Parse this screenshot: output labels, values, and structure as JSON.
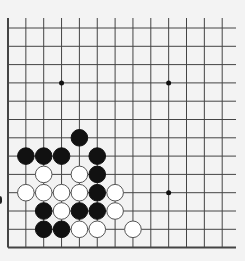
{
  "board": {
    "size": 13,
    "origin_x": 8,
    "origin_y": 28,
    "spacing_x": 17.85,
    "spacing_y": 18.3,
    "top_extend": 18,
    "right_extend": 236,
    "line_color": "#444444",
    "background": "#f3f3f3",
    "stone_radius": 8.3,
    "black_color": "#111111",
    "white_color": "#ffffff",
    "white_stroke": "#555555",
    "star_points": [
      [
        3,
        3
      ],
      [
        9,
        3
      ],
      [
        9,
        9
      ]
    ],
    "stones": [
      {
        "color": "black",
        "col": 4,
        "row": 6
      },
      {
        "color": "black",
        "col": 1,
        "row": 7
      },
      {
        "color": "black",
        "col": 2,
        "row": 7
      },
      {
        "color": "black",
        "col": 3,
        "row": 7
      },
      {
        "color": "black",
        "col": 5,
        "row": 7
      },
      {
        "color": "white",
        "col": 2,
        "row": 8
      },
      {
        "color": "white",
        "col": 4,
        "row": 8
      },
      {
        "color": "black",
        "col": 5,
        "row": 8
      },
      {
        "color": "white",
        "col": 1,
        "row": 9
      },
      {
        "color": "white",
        "col": 2,
        "row": 9
      },
      {
        "color": "white",
        "col": 3,
        "row": 9
      },
      {
        "color": "white",
        "col": 4,
        "row": 9
      },
      {
        "color": "black",
        "col": 5,
        "row": 9
      },
      {
        "color": "white",
        "col": 6,
        "row": 9
      },
      {
        "color": "black",
        "col": 2,
        "row": 10
      },
      {
        "color": "white",
        "col": 3,
        "row": 10
      },
      {
        "color": "black",
        "col": 4,
        "row": 10
      },
      {
        "color": "black",
        "col": 5,
        "row": 10
      },
      {
        "color": "white",
        "col": 6,
        "row": 10
      },
      {
        "color": "black",
        "col": 2,
        "row": 11
      },
      {
        "color": "black",
        "col": 3,
        "row": 11
      },
      {
        "color": "white",
        "col": 4,
        "row": 11
      },
      {
        "color": "white",
        "col": 5,
        "row": 11
      },
      {
        "color": "white",
        "col": 7,
        "row": 11
      }
    ]
  }
}
